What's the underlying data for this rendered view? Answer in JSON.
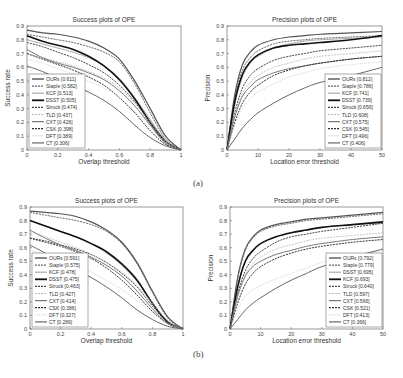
{
  "captions": {
    "a": "(a)",
    "b": "(b)"
  },
  "chart_data": [
    {
      "id": "a-success",
      "type": "line",
      "title": "Success plots of OPE",
      "xlabel": "Overlap threshold",
      "ylabel": "Success rate",
      "xlim": [
        0,
        1
      ],
      "ylim": [
        0,
        0.9
      ],
      "xticks": [
        "0",
        "0.2",
        "0.4",
        "0.6",
        "0.8",
        "1"
      ],
      "xtick_values": [
        0,
        0.2,
        0.4,
        0.6,
        0.8,
        1
      ],
      "yticks": [
        "0",
        "0.1",
        "0.2",
        "0.3",
        "0.4",
        "0.5",
        "0.6",
        "0.7",
        "0.8",
        "0.9"
      ],
      "ytick_values": [
        0,
        0.1,
        0.2,
        0.3,
        0.4,
        0.5,
        0.6,
        0.7,
        0.8,
        0.9
      ],
      "legend_position": "bottom-left",
      "x": [
        0,
        0.1,
        0.2,
        0.3,
        0.4,
        0.5,
        0.6,
        0.7,
        0.8,
        0.9,
        1.0
      ],
      "series": [
        {
          "name": "OURs [0.611]",
          "values": [
            0.87,
            0.85,
            0.84,
            0.82,
            0.79,
            0.74,
            0.66,
            0.5,
            0.3,
            0.1,
            0.0
          ],
          "color": "#555555",
          "dash": "",
          "width": 1.2
        },
        {
          "name": "Staple [0.582]",
          "values": [
            0.84,
            0.82,
            0.8,
            0.78,
            0.75,
            0.71,
            0.64,
            0.48,
            0.27,
            0.08,
            0.0
          ],
          "color": "#666666",
          "dash": "2,1",
          "width": 1.0
        },
        {
          "name": "KCF [0.513]",
          "values": [
            0.8,
            0.77,
            0.74,
            0.71,
            0.67,
            0.61,
            0.52,
            0.38,
            0.22,
            0.07,
            0.0
          ],
          "color": "#aaaaaa",
          "dash": "",
          "width": 1.0
        },
        {
          "name": "DSST [0.505]",
          "values": [
            0.83,
            0.79,
            0.76,
            0.73,
            0.68,
            0.61,
            0.51,
            0.37,
            0.2,
            0.06,
            0.0
          ],
          "color": "#111111",
          "dash": "",
          "width": 1.6
        },
        {
          "name": "Struck [0.474]",
          "values": [
            0.78,
            0.75,
            0.71,
            0.67,
            0.62,
            0.56,
            0.47,
            0.35,
            0.19,
            0.05,
            0.0
          ],
          "color": "#444444",
          "dash": "2,1",
          "width": 1.0
        },
        {
          "name": "TLD [0.437]",
          "values": [
            0.7,
            0.67,
            0.64,
            0.61,
            0.57,
            0.52,
            0.45,
            0.34,
            0.2,
            0.06,
            0.0
          ],
          "color": "#bbbbbb",
          "dash": "2,1",
          "width": 0.8
        },
        {
          "name": "CXT [0.426]",
          "values": [
            0.73,
            0.67,
            0.63,
            0.6,
            0.56,
            0.51,
            0.43,
            0.32,
            0.18,
            0.05,
            0.0
          ],
          "color": "#777777",
          "dash": "",
          "width": 1.0
        },
        {
          "name": "CSK [0.398]",
          "values": [
            0.7,
            0.66,
            0.62,
            0.58,
            0.53,
            0.47,
            0.38,
            0.27,
            0.14,
            0.04,
            0.0
          ],
          "color": "#333333",
          "dash": "2,1",
          "width": 1.0
        },
        {
          "name": "DFT [0.389]",
          "values": [
            0.66,
            0.63,
            0.59,
            0.55,
            0.5,
            0.45,
            0.38,
            0.28,
            0.16,
            0.05,
            0.0
          ],
          "color": "#cccccc",
          "dash": "1,1",
          "width": 0.8
        },
        {
          "name": "CT [0.306]",
          "values": [
            0.61,
            0.57,
            0.52,
            0.47,
            0.42,
            0.36,
            0.28,
            0.18,
            0.09,
            0.03,
            0.0
          ],
          "color": "#666666",
          "dash": "",
          "width": 1.0
        }
      ]
    },
    {
      "id": "a-precision",
      "type": "line",
      "title": "Precision plots of OPE",
      "xlabel": "Location error threshold",
      "ylabel": "Precision",
      "xlim": [
        0,
        50
      ],
      "ylim": [
        0,
        0.9
      ],
      "xticks": [
        "0",
        "10",
        "20",
        "30",
        "40",
        "50"
      ],
      "xtick_values": [
        0,
        10,
        20,
        30,
        40,
        50
      ],
      "yticks": [
        "0",
        "0.1",
        "0.2",
        "0.3",
        "0.4",
        "0.5",
        "0.6",
        "0.7",
        "0.8",
        "0.9"
      ],
      "ytick_values": [
        0,
        0.1,
        0.2,
        0.3,
        0.4,
        0.5,
        0.6,
        0.7,
        0.8,
        0.9
      ],
      "legend_position": "bottom-right",
      "x": [
        0,
        2.5,
        5,
        7.5,
        10,
        15,
        20,
        25,
        30,
        40,
        50
      ],
      "series": [
        {
          "name": "OURs [0.812]",
          "values": [
            0.0,
            0.4,
            0.62,
            0.71,
            0.76,
            0.8,
            0.82,
            0.83,
            0.84,
            0.85,
            0.86
          ],
          "color": "#555555",
          "dash": "",
          "width": 1.2
        },
        {
          "name": "Staple [0.786]",
          "values": [
            0.0,
            0.37,
            0.58,
            0.67,
            0.72,
            0.77,
            0.79,
            0.8,
            0.81,
            0.82,
            0.83
          ],
          "color": "#666666",
          "dash": "2,1",
          "width": 1.0
        },
        {
          "name": "KCF [0.741]",
          "values": [
            0.0,
            0.33,
            0.53,
            0.63,
            0.68,
            0.74,
            0.77,
            0.79,
            0.8,
            0.81,
            0.82
          ],
          "color": "#aaaaaa",
          "dash": "",
          "width": 1.0
        },
        {
          "name": "DSST [0.739]",
          "values": [
            0.0,
            0.35,
            0.55,
            0.64,
            0.69,
            0.74,
            0.76,
            0.77,
            0.78,
            0.8,
            0.83
          ],
          "color": "#111111",
          "dash": "",
          "width": 1.6
        },
        {
          "name": "Struck [0.656]",
          "values": [
            0.0,
            0.27,
            0.45,
            0.54,
            0.59,
            0.65,
            0.68,
            0.7,
            0.72,
            0.74,
            0.76
          ],
          "color": "#444444",
          "dash": "2,1",
          "width": 1.0
        },
        {
          "name": "TLD [0.608]",
          "values": [
            0.0,
            0.25,
            0.41,
            0.49,
            0.54,
            0.6,
            0.63,
            0.66,
            0.68,
            0.7,
            0.72
          ],
          "color": "#bbbbbb",
          "dash": "2,1",
          "width": 0.8
        },
        {
          "name": "CXT [0.575]",
          "values": [
            0.0,
            0.24,
            0.39,
            0.46,
            0.51,
            0.56,
            0.59,
            0.61,
            0.63,
            0.66,
            0.68
          ],
          "color": "#777777",
          "dash": "",
          "width": 1.0
        },
        {
          "name": "CSK [0.545]",
          "values": [
            0.0,
            0.2,
            0.34,
            0.42,
            0.47,
            0.54,
            0.58,
            0.61,
            0.63,
            0.66,
            0.68
          ],
          "color": "#333333",
          "dash": "2,1",
          "width": 1.0
        },
        {
          "name": "DFT [0.496]",
          "values": [
            0.0,
            0.18,
            0.3,
            0.37,
            0.42,
            0.48,
            0.53,
            0.56,
            0.59,
            0.62,
            0.64
          ],
          "color": "#cccccc",
          "dash": "1,1",
          "width": 0.8
        },
        {
          "name": "CT [0.406]",
          "values": [
            0.0,
            0.08,
            0.16,
            0.22,
            0.27,
            0.34,
            0.4,
            0.45,
            0.49,
            0.54,
            0.6
          ],
          "color": "#666666",
          "dash": "",
          "width": 1.0
        }
      ]
    },
    {
      "id": "b-success",
      "type": "line",
      "title": "Success plots of OPE",
      "xlabel": "Overlap threshold",
      "ylabel": "Success rate",
      "xlim": [
        0,
        1
      ],
      "ylim": [
        0,
        0.9
      ],
      "xticks": [
        "0",
        "0.2",
        "0.4",
        "0.6",
        "0.8",
        "1"
      ],
      "xtick_values": [
        0,
        0.2,
        0.4,
        0.6,
        0.8,
        1
      ],
      "yticks": [
        "0",
        "0.1",
        "0.2",
        "0.3",
        "0.4",
        "0.5",
        "0.6",
        "0.7",
        "0.8",
        "0.9"
      ],
      "ytick_values": [
        0,
        0.1,
        0.2,
        0.3,
        0.4,
        0.5,
        0.6,
        0.7,
        0.8,
        0.9
      ],
      "legend_position": "bottom-left",
      "x": [
        0,
        0.1,
        0.2,
        0.3,
        0.4,
        0.5,
        0.6,
        0.7,
        0.8,
        0.9,
        1.0
      ],
      "series": [
        {
          "name": "OURs [0.591]",
          "values": [
            0.87,
            0.86,
            0.85,
            0.83,
            0.79,
            0.73,
            0.64,
            0.49,
            0.28,
            0.09,
            0.0
          ],
          "color": "#555555",
          "dash": "",
          "width": 1.2
        },
        {
          "name": "Staple [0.575]",
          "values": [
            0.86,
            0.84,
            0.82,
            0.8,
            0.77,
            0.72,
            0.63,
            0.48,
            0.27,
            0.08,
            0.0
          ],
          "color": "#666666",
          "dash": "2,1",
          "width": 1.0
        },
        {
          "name": "KCF [0.478]",
          "values": [
            0.8,
            0.76,
            0.72,
            0.68,
            0.63,
            0.56,
            0.47,
            0.35,
            0.19,
            0.06,
            0.0
          ],
          "color": "#aaaaaa",
          "dash": "",
          "width": 1.0
        },
        {
          "name": "DSST [0.475]",
          "values": [
            0.8,
            0.76,
            0.72,
            0.68,
            0.63,
            0.57,
            0.48,
            0.36,
            0.19,
            0.05,
            0.0
          ],
          "color": "#111111",
          "dash": "",
          "width": 1.6
        },
        {
          "name": "Struck [0.463]",
          "values": [
            0.67,
            0.65,
            0.62,
            0.59,
            0.55,
            0.49,
            0.41,
            0.31,
            0.17,
            0.05,
            0.0
          ],
          "color": "#444444",
          "dash": "2,1",
          "width": 1.0
        },
        {
          "name": "TLD [0.427]",
          "values": [
            0.72,
            0.68,
            0.64,
            0.6,
            0.55,
            0.49,
            0.42,
            0.32,
            0.19,
            0.06,
            0.0
          ],
          "color": "#bbbbbb",
          "dash": "2,1",
          "width": 0.8
        },
        {
          "name": "CXT [0.414]",
          "values": [
            0.73,
            0.67,
            0.62,
            0.58,
            0.53,
            0.47,
            0.39,
            0.28,
            0.15,
            0.04,
            0.0
          ],
          "color": "#777777",
          "dash": "",
          "width": 1.0
        },
        {
          "name": "CSK [0.386]",
          "values": [
            0.67,
            0.64,
            0.61,
            0.57,
            0.52,
            0.45,
            0.36,
            0.25,
            0.13,
            0.04,
            0.0
          ],
          "color": "#333333",
          "dash": "2,1",
          "width": 1.0
        },
        {
          "name": "DFT [0.327]",
          "values": [
            0.58,
            0.55,
            0.51,
            0.47,
            0.42,
            0.36,
            0.29,
            0.21,
            0.12,
            0.04,
            0.0
          ],
          "color": "#cccccc",
          "dash": "1,1",
          "width": 0.8
        },
        {
          "name": "CT [0.289]",
          "values": [
            0.62,
            0.56,
            0.5,
            0.44,
            0.38,
            0.31,
            0.23,
            0.14,
            0.07,
            0.02,
            0.0
          ],
          "color": "#666666",
          "dash": "",
          "width": 1.0
        }
      ]
    },
    {
      "id": "b-precision",
      "type": "line",
      "title": "Precision plots of OPE",
      "xlabel": "Location error threshold",
      "ylabel": "Precision",
      "xlim": [
        0,
        50
      ],
      "ylim": [
        0,
        0.9
      ],
      "xticks": [
        "0",
        "10",
        "20",
        "30",
        "40",
        "50"
      ],
      "xtick_values": [
        0,
        10,
        20,
        30,
        40,
        50
      ],
      "yticks": [
        "0",
        "0.1",
        "0.2",
        "0.3",
        "0.4",
        "0.5",
        "0.6",
        "0.7",
        "0.8",
        "0.9"
      ],
      "ytick_values": [
        0,
        0.1,
        0.2,
        0.3,
        0.4,
        0.5,
        0.6,
        0.7,
        0.8,
        0.9
      ],
      "legend_position": "bottom-right",
      "x": [
        0,
        2.5,
        5,
        7.5,
        10,
        15,
        20,
        25,
        30,
        40,
        50
      ],
      "series": [
        {
          "name": "OURs [0.792]",
          "values": [
            0.0,
            0.38,
            0.59,
            0.68,
            0.73,
            0.77,
            0.79,
            0.81,
            0.82,
            0.84,
            0.86
          ],
          "color": "#555555",
          "dash": "",
          "width": 1.2
        },
        {
          "name": "Staple [0.779]",
          "values": [
            0.0,
            0.37,
            0.58,
            0.67,
            0.72,
            0.76,
            0.78,
            0.8,
            0.81,
            0.83,
            0.85
          ],
          "color": "#666666",
          "dash": "2,1",
          "width": 1.0
        },
        {
          "name": "DSST [0.695]",
          "values": [
            0.0,
            0.31,
            0.5,
            0.58,
            0.63,
            0.68,
            0.71,
            0.73,
            0.75,
            0.77,
            0.78
          ],
          "color": "#aaaaaa",
          "dash": "",
          "width": 1.0
        },
        {
          "name": "KCF [0.693]",
          "values": [
            0.0,
            0.31,
            0.5,
            0.58,
            0.63,
            0.68,
            0.71,
            0.73,
            0.75,
            0.77,
            0.79
          ],
          "color": "#111111",
          "dash": "",
          "width": 1.6
        },
        {
          "name": "Struck [0.640]",
          "values": [
            0.0,
            0.26,
            0.43,
            0.52,
            0.57,
            0.64,
            0.68,
            0.7,
            0.72,
            0.75,
            0.78
          ],
          "color": "#444444",
          "dash": "2,1",
          "width": 1.0
        },
        {
          "name": "TLD [0.597]",
          "values": [
            0.0,
            0.24,
            0.4,
            0.48,
            0.53,
            0.59,
            0.62,
            0.65,
            0.67,
            0.69,
            0.71
          ],
          "color": "#bbbbbb",
          "dash": "2,1",
          "width": 0.8
        },
        {
          "name": "CXT [0.566]",
          "values": [
            0.0,
            0.24,
            0.39,
            0.46,
            0.5,
            0.55,
            0.58,
            0.61,
            0.63,
            0.66,
            0.68
          ],
          "color": "#777777",
          "dash": "",
          "width": 1.0
        },
        {
          "name": "CSK [0.521]",
          "values": [
            0.0,
            0.19,
            0.33,
            0.41,
            0.46,
            0.52,
            0.56,
            0.59,
            0.61,
            0.64,
            0.66
          ],
          "color": "#333333",
          "dash": "2,1",
          "width": 1.0
        },
        {
          "name": "DFT [0.413]",
          "values": [
            0.0,
            0.14,
            0.24,
            0.29,
            0.32,
            0.37,
            0.41,
            0.45,
            0.49,
            0.54,
            0.58
          ],
          "color": "#cccccc",
          "dash": "1,1",
          "width": 0.8
        },
        {
          "name": "CT [0.366]",
          "values": [
            0.0,
            0.07,
            0.14,
            0.19,
            0.23,
            0.3,
            0.36,
            0.41,
            0.46,
            0.53,
            0.59
          ],
          "color": "#666666",
          "dash": "",
          "width": 1.0
        }
      ]
    }
  ]
}
